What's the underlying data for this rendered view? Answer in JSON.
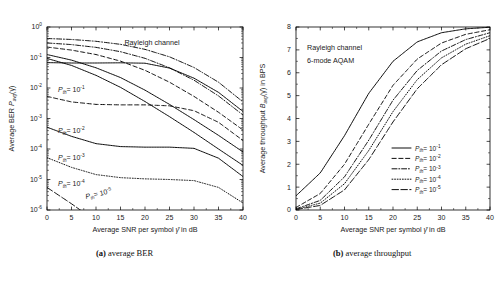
{
  "figure": {
    "subcaptions": [
      {
        "tag": "(a)",
        "text": " average BER"
      },
      {
        "tag": "(b)",
        "text": " average throughput"
      }
    ]
  },
  "panel_a": {
    "annotation": "Rayleigh channel",
    "xlabel_pre": "Average SNR per symbol ",
    "xlabel_sym": "γ̄",
    "xlabel_post": " in dB",
    "ylabel_pre": "Average BER ",
    "ylabel_sym": "P",
    "ylabel_sub": "avg",
    "ylabel_post": "(γ̄)",
    "curve_labels": [
      {
        "prefix": "P",
        "sub": "th",
        "eq": "= 10",
        "exp": "-1"
      },
      {
        "prefix": "P",
        "sub": "th",
        "eq": "= 10",
        "exp": "-2"
      },
      {
        "prefix": "P",
        "sub": "th",
        "eq": "= 10",
        "exp": "-3"
      },
      {
        "prefix": "P",
        "sub": "th",
        "eq": "= 10",
        "exp": "-4"
      },
      {
        "prefix": "P",
        "sub": "th",
        "eq": "= 10",
        "exp": "-5"
      }
    ]
  },
  "panel_b": {
    "annotations": [
      "Rayleigh channel",
      "6-mode AQAM"
    ],
    "xlabel_pre": "Average SNR per symbol ",
    "xlabel_sym": "γ̄",
    "xlabel_post": " in dB",
    "ylabel_pre": "Average throughput ",
    "ylabel_sym": "B",
    "ylabel_sub": "avg",
    "ylabel_post": "(γ̄) in BPS",
    "legend": [
      {
        "prefix": "P",
        "sub": "th",
        "eq": "= 10",
        "exp": "-1",
        "style": "solid"
      },
      {
        "prefix": "P",
        "sub": "th",
        "eq": "= 10",
        "exp": "-2",
        "style": "dashed"
      },
      {
        "prefix": "P",
        "sub": "th",
        "eq": "= 10",
        "exp": "-3",
        "style": "dashdot"
      },
      {
        "prefix": "P",
        "sub": "th",
        "eq": "= 10",
        "exp": "-4",
        "style": "dotted"
      },
      {
        "prefix": "P",
        "sub": "th",
        "eq": "= 10",
        "exp": "-5",
        "style": "longdash"
      }
    ]
  },
  "chart_data": [
    {
      "type": "line",
      "id": "average-ber",
      "title": "(a) average BER",
      "xlabel": "Average SNR per symbol γ̄ in dB",
      "ylabel": "Average BER P_avg(γ̄)",
      "xlim": [
        0,
        40
      ],
      "xticks": [
        0,
        5,
        10,
        15,
        20,
        25,
        30,
        35,
        40
      ],
      "yscale": "log",
      "ylim": [
        1e-06,
        1
      ],
      "yticks": [
        1,
        0.1,
        0.01,
        0.001,
        0.0001,
        1e-05,
        1e-06
      ],
      "ytick_labels": [
        "10^0",
        "10^-1",
        "10^-2",
        "10^-3",
        "10^-4",
        "10^-5",
        "10^-6"
      ],
      "grid": false,
      "legend_position": "none",
      "annotations": [
        "Rayleigh channel"
      ],
      "x": [
        0,
        5,
        10,
        15,
        20,
        25,
        30,
        35,
        40
      ],
      "series": [
        {
          "name": "P_th = 10^-1",
          "style": "solid",
          "values": [
            0.068,
            0.066,
            0.066,
            0.067,
            0.065,
            0.045,
            0.021,
            0.0072,
            0.0017
          ]
        },
        {
          "name": "P_th = 10^-2",
          "style": "dashed",
          "values": [
            0.0053,
            0.0035,
            0.0029,
            0.0028,
            0.0028,
            0.0026,
            0.0018,
            0.00075,
            0.00019
          ]
        },
        {
          "name": "P_th = 10^-3",
          "style": "solid",
          "values": [
            0.00052,
            0.00026,
            0.00015,
            0.00012,
            0.000115,
            0.000115,
            0.000105,
            5e-05,
            1.25e-05
          ]
        },
        {
          "name": "P_th = 10^-4",
          "style": "dotted",
          "values": [
            5.2e-05,
            2.5e-05,
            1.45e-05,
            1.15e-05,
            1.05e-05,
            1e-05,
            9.2e-06,
            5.5e-06,
            1.7e-06
          ]
        },
        {
          "name": "P_th = 10^-5",
          "style": "longdash",
          "values": [
            5.5e-06,
            1.6e-06,
            4.3e-07,
            1.2e-07,
            3e-08,
            9e-09,
            2.5e-09,
            8e-10,
            2.5e-10
          ]
        },
        {
          "name": "upper-faint-1",
          "style": "dashdot-faint",
          "values": [
            0.42,
            0.39,
            0.34,
            0.27,
            0.185,
            0.105,
            0.047,
            0.0155,
            0.0035
          ]
        },
        {
          "name": "upper-faint-2",
          "style": "dashdot-faint",
          "values": [
            0.3,
            0.265,
            0.215,
            0.155,
            0.094,
            0.046,
            0.018,
            0.0055,
            0.0013
          ]
        },
        {
          "name": "upper-faint-3",
          "style": "dashed-faint",
          "values": [
            0.22,
            0.175,
            0.125,
            0.076,
            0.038,
            0.0155,
            0.0053,
            0.0016,
            0.00042
          ]
        },
        {
          "name": "upper-faint-4",
          "style": "solid-faint",
          "values": [
            0.125,
            0.082,
            0.046,
            0.022,
            0.0085,
            0.0029,
            0.00092,
            0.00028,
            8e-05
          ]
        },
        {
          "name": "upper-faint-5",
          "style": "solid-faint",
          "values": [
            0.093,
            0.055,
            0.026,
            0.0105,
            0.0036,
            0.00115,
            0.00035,
            0.0001,
            2.9e-05
          ]
        }
      ]
    },
    {
      "type": "line",
      "id": "average-throughput",
      "title": "(b) average throughput",
      "xlabel": "Average SNR per symbol γ̄ in dB",
      "ylabel": "Average throughput B_avg(γ̄) in BPS",
      "xlim": [
        0,
        40
      ],
      "xticks": [
        0,
        5,
        10,
        15,
        20,
        25,
        30,
        35,
        40
      ],
      "yscale": "linear",
      "ylim": [
        0,
        8
      ],
      "yticks": [
        0,
        1,
        2,
        3,
        4,
        5,
        6,
        7,
        8
      ],
      "grid": false,
      "legend_position": "lower-right",
      "annotations": [
        "Rayleigh channel",
        "6-mode AQAM"
      ],
      "x": [
        0,
        5,
        10,
        15,
        20,
        25,
        30,
        35,
        40
      ],
      "series": [
        {
          "name": "P_th = 10^-1",
          "style": "solid",
          "values": [
            0.62,
            1.62,
            3.25,
            5.1,
            6.5,
            7.35,
            7.75,
            7.92,
            7.99
          ]
        },
        {
          "name": "P_th = 10^-2",
          "style": "dashed",
          "values": [
            0.11,
            0.72,
            2.0,
            3.75,
            5.45,
            6.6,
            7.3,
            7.68,
            7.88
          ]
        },
        {
          "name": "P_th = 10^-3",
          "style": "dashdot",
          "values": [
            0.05,
            0.42,
            1.45,
            3.05,
            4.8,
            6.1,
            6.95,
            7.45,
            7.75
          ]
        },
        {
          "name": "P_th = 10^-4",
          "style": "dotted",
          "values": [
            0.03,
            0.3,
            1.15,
            2.6,
            4.3,
            5.7,
            6.65,
            7.25,
            7.62
          ]
        },
        {
          "name": "P_th = 10^-5",
          "style": "longdash",
          "values": [
            0.02,
            0.2,
            0.88,
            2.2,
            3.85,
            5.3,
            6.35,
            7.05,
            7.5
          ]
        }
      ]
    }
  ]
}
